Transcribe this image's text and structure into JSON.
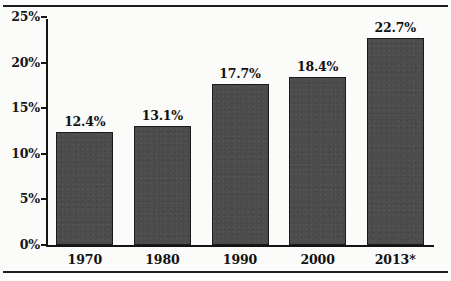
{
  "chart_data": {
    "type": "bar",
    "title": "",
    "subtitle": "",
    "xlabel": "",
    "ylabel": "",
    "categories": [
      "1970",
      "1980",
      "1990",
      "2000",
      "2013*"
    ],
    "values": [
      12.4,
      13.1,
      17.7,
      18.4,
      22.7
    ],
    "value_labels": [
      "12.4%",
      "13.1%",
      "17.7%",
      "18.4%",
      "22.7%"
    ],
    "ylim": [
      0,
      25
    ],
    "ytick_values": [
      0,
      5,
      10,
      15,
      20,
      25
    ],
    "ytick_labels": [
      "0%",
      "5%",
      "10%",
      "15%",
      "20%",
      "25%"
    ],
    "grid": false,
    "legend": null,
    "series": [
      {
        "name": "",
        "values": [
          12.4,
          13.1,
          17.7,
          18.4,
          22.7
        ]
      }
    ],
    "annotations": [],
    "colors": {
      "bar_fill": "#4b4b4b",
      "bar_stroke": "#1b1b1b",
      "axis": "#141414",
      "text": "#111111",
      "background": "#fbfbf9",
      "rule": "#1d1d1d"
    }
  }
}
